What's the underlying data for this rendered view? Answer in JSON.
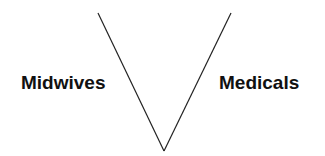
{
  "diagram": {
    "type": "v-shape",
    "labels": {
      "left": "Midwives",
      "right": "Medicals"
    },
    "lines": [
      {
        "name": "left-arm",
        "x1": 98,
        "y1": 13,
        "x2": 164,
        "y2": 151
      },
      {
        "name": "right-arm",
        "x1": 231,
        "y1": 13,
        "x2": 164,
        "y2": 151
      }
    ],
    "colors": {
      "line": "#222222",
      "text": "#111111",
      "background": "#ffffff"
    }
  }
}
